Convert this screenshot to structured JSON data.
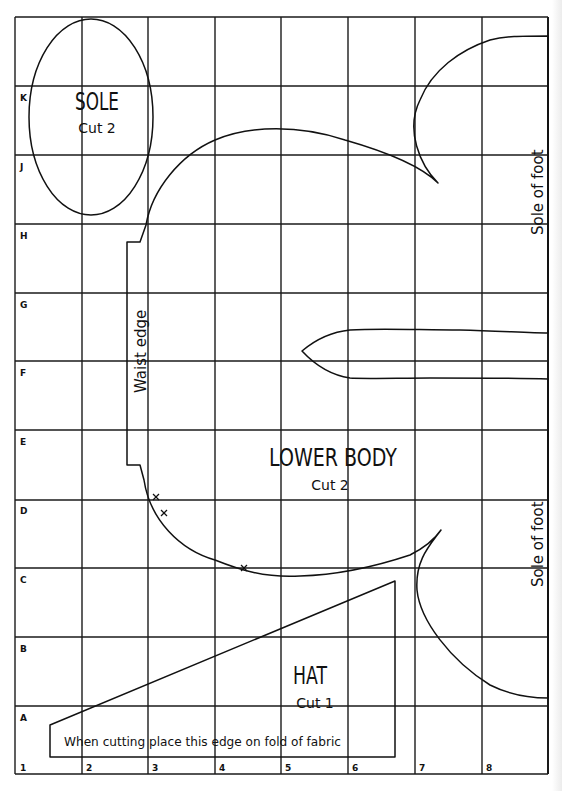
{
  "grid": {
    "columns": [
      "1",
      "2",
      "3",
      "4",
      "5",
      "6",
      "7",
      "8"
    ],
    "rows": [
      "K",
      "J",
      "H",
      "G",
      "F",
      "E",
      "D",
      "C",
      "B",
      "A"
    ]
  },
  "pieces": {
    "sole": {
      "title": "SOLE",
      "cut": "Cut 2"
    },
    "lower_body": {
      "title": "LOWER BODY",
      "cut": "Cut 2",
      "waist_label": "Waist edge",
      "foot_label_top": "Sole of foot",
      "foot_label_bottom": "Sole of foot"
    },
    "hat": {
      "title": "HAT",
      "cut": "Cut 1",
      "fold_note": "When cutting place this edge on fold of fabric"
    }
  },
  "colors": {
    "ink": "#111111",
    "paper": "#ffffff"
  }
}
